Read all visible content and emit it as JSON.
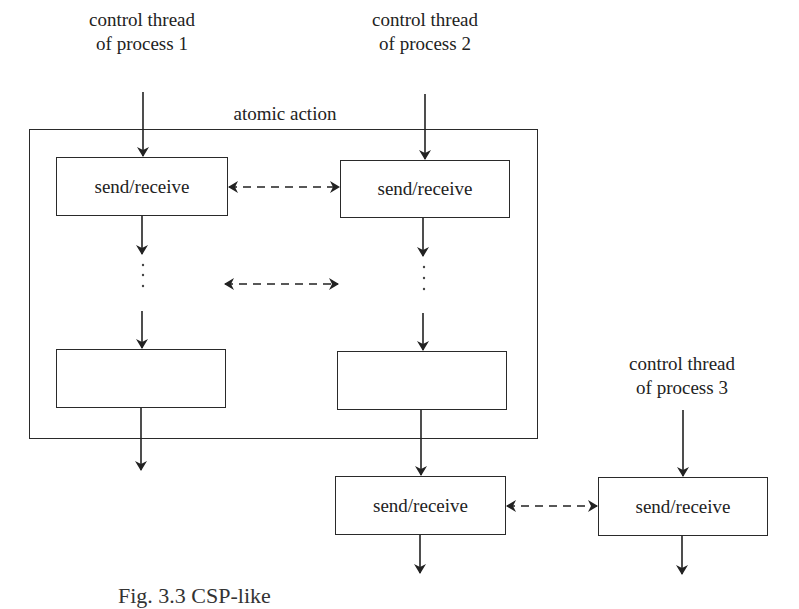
{
  "diagram": {
    "thread1": {
      "line1": "control thread",
      "line2": "of process 1"
    },
    "thread2": {
      "line1": "control thread",
      "line2": "of process 2"
    },
    "thread3": {
      "line1": "control thread",
      "line2": "of process 3"
    },
    "atomic_action_label": "atomic action",
    "boxes": {
      "p1_top": "send/receive",
      "p2_top": "send/receive",
      "p1_bottom": "",
      "p2_bottom": "",
      "p2_after": "send/receive",
      "p3": "send/receive"
    },
    "ellipsis": "⋮"
  },
  "caption": "Fig. 3.3  CSP-like"
}
